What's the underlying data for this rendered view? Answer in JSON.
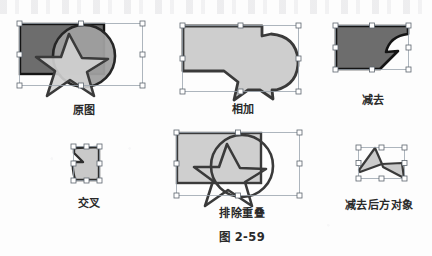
{
  "figure": {
    "caption": "图 2-59",
    "page_background": "#fdfdfd"
  },
  "style": {
    "stroke": "#1d1d1d",
    "rect_fill_dark": "#6d6d6d",
    "shape_fill_light": "#cfcfcf",
    "shape_fill_mid": "#a9a9a9",
    "selection_line": "#9aa3ad",
    "handle_fill": "#ffffff",
    "handle_stroke": "#5d656e",
    "text_color": "#2a2a2a"
  },
  "panels": [
    {
      "id": "original",
      "label": "原图",
      "op": "none",
      "selected": true,
      "handles": 8,
      "shapes": [
        "rectangle",
        "circle",
        "star"
      ]
    },
    {
      "id": "unite",
      "label": "相加",
      "op": "add",
      "selected": true,
      "handles": 8,
      "shapes": [
        "merged-outline"
      ]
    },
    {
      "id": "minus-front",
      "label": "减去",
      "op": "subtract",
      "selected": true,
      "handles": 8,
      "shapes": [
        "rectangle-with-notch"
      ]
    },
    {
      "id": "intersect",
      "label": "交叉",
      "op": "intersect",
      "selected": true,
      "handles": 8,
      "shapes": [
        "intersection-region"
      ]
    },
    {
      "id": "exclude",
      "label": "排除重叠",
      "op": "exclude",
      "selected": true,
      "handles": 8,
      "shapes": [
        "rectangle-outline",
        "circle-outline",
        "star-outline"
      ]
    },
    {
      "id": "minus-back",
      "label": "减去后方对象",
      "op": "minus-back",
      "selected": true,
      "handles": 8,
      "shapes": [
        "star-remnants"
      ]
    }
  ]
}
